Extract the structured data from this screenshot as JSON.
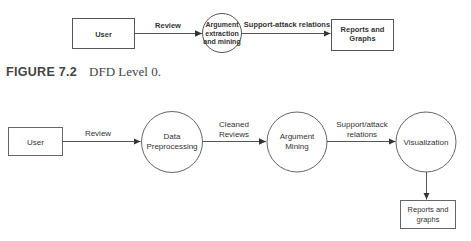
{
  "diagrams": [
    {
      "level": 0,
      "nodes": [
        {
          "id": "user",
          "type": "external-entity",
          "label": [
            "User"
          ]
        },
        {
          "id": "argument-extraction",
          "type": "process",
          "label": [
            "Argument",
            "extraction",
            "and mining"
          ]
        },
        {
          "id": "reports",
          "type": "external-entity",
          "label": [
            "Reports and",
            "Graphs"
          ]
        }
      ],
      "flows": [
        {
          "from": "user",
          "to": "argument-extraction",
          "label": [
            "Review"
          ]
        },
        {
          "from": "argument-extraction",
          "to": "reports",
          "label": [
            "Support-attack relations"
          ]
        }
      ]
    },
    {
      "level": 1,
      "nodes": [
        {
          "id": "user",
          "type": "external-entity",
          "label": [
            "User"
          ]
        },
        {
          "id": "data-preprocessing",
          "type": "process",
          "label": [
            "Data",
            "Preprocessing"
          ]
        },
        {
          "id": "argument-mining",
          "type": "process",
          "label": [
            "Argument",
            "Mining"
          ]
        },
        {
          "id": "visualization",
          "type": "process",
          "label": [
            "Visualization"
          ]
        },
        {
          "id": "reports",
          "type": "external-entity",
          "label": [
            "Reports and",
            "graphs"
          ]
        }
      ],
      "flows": [
        {
          "from": "user",
          "to": "data-preprocessing",
          "label": [
            "Review"
          ]
        },
        {
          "from": "data-preprocessing",
          "to": "argument-mining",
          "label": [
            "Cleaned",
            "Reviews"
          ]
        },
        {
          "from": "argument-mining",
          "to": "visualization",
          "label": [
            "Support/attack",
            "relations"
          ]
        },
        {
          "from": "visualization",
          "to": "reports",
          "label": []
        }
      ]
    }
  ],
  "caption": {
    "figure_label": "FIGURE 7.2",
    "text": "DFD Level 0."
  },
  "colors": {
    "stroke": "#555555",
    "text": "#333333",
    "background": "#ffffff"
  }
}
